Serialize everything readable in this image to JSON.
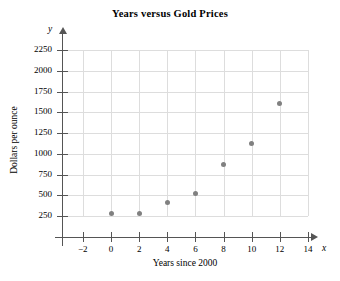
{
  "chart_data": {
    "type": "scatter",
    "title": "Years versus Gold Prices",
    "xlabel": "Years since 2000",
    "ylabel": "Dollars per ounce",
    "x_axis_letter": "x",
    "y_axis_letter": "y",
    "xlim": [
      -3,
      15
    ],
    "ylim": [
      0,
      2375
    ],
    "xticks": [
      -2,
      0,
      2,
      4,
      6,
      8,
      10,
      12,
      14
    ],
    "xtick_labels": [
      "−2",
      "0",
      "2",
      "4",
      "6",
      "8",
      "10",
      "12",
      "14"
    ],
    "yticks": [
      250,
      500,
      750,
      1000,
      1250,
      1500,
      1750,
      2000,
      2250
    ],
    "ytick_labels": [
      "250",
      "500",
      "750",
      "1000",
      "1250",
      "1500",
      "1750",
      "2000",
      "2250"
    ],
    "grid": true,
    "grid_color": "#dddddd",
    "marker_color": "#808080",
    "axis_color": "#555555",
    "x": [
      0,
      2,
      4,
      6,
      8,
      10,
      12
    ],
    "y": [
      280,
      275,
      410,
      520,
      870,
      1120,
      1600
    ],
    "points": [
      {
        "x": 0,
        "y": 280
      },
      {
        "x": 2,
        "y": 275
      },
      {
        "x": 4,
        "y": 410
      },
      {
        "x": 6,
        "y": 520
      },
      {
        "x": 8,
        "y": 870
      },
      {
        "x": 10,
        "y": 1120
      },
      {
        "x": 12,
        "y": 1600
      }
    ]
  }
}
